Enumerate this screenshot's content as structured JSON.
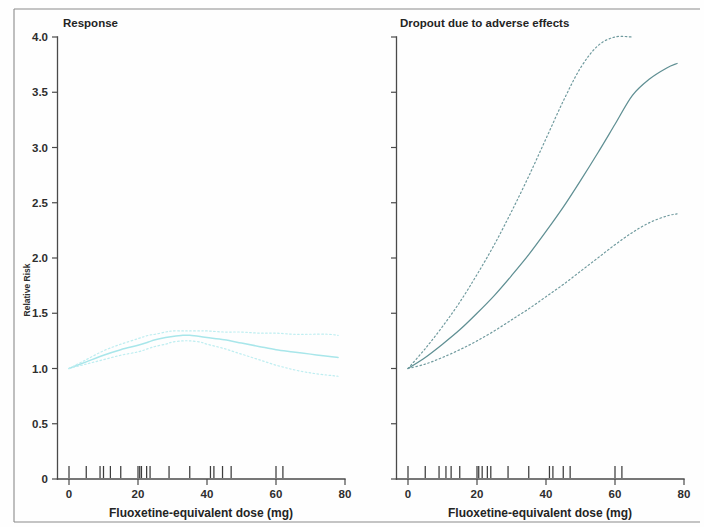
{
  "figure": {
    "kind": "two-panel-dose-response-figure",
    "x_axis_title": "Fluoxetine-equivalent dose (mg)",
    "y_axis_title": "Relative Risk"
  },
  "chart_data": [
    {
      "type": "line",
      "panel": "left",
      "title": "Response",
      "xlabel": "Fluoxetine-equivalent dose (mg)",
      "ylabel": "Relative Risk",
      "xlim": [
        0,
        80
      ],
      "ylim": [
        0,
        4.0
      ],
      "xticks": [
        0,
        20,
        40,
        60,
        80
      ],
      "xticklabels": [
        "0",
        "20",
        "40",
        "60",
        "80"
      ],
      "yticks": [
        0,
        0.5,
        1.0,
        1.5,
        2.0,
        2.5,
        3.0,
        3.5,
        4.0
      ],
      "yticklabels": [
        "0",
        "0.5",
        "1.0",
        "1.5",
        "2.0",
        "2.5",
        "3.0",
        "3.5",
        "4.0"
      ],
      "grid": false,
      "legend": "none",
      "line_color": "#a8e6ea",
      "ci_color": "#bfeef1",
      "x": [
        0,
        5,
        10,
        15,
        20,
        23,
        25,
        28,
        30,
        33,
        35,
        38,
        40,
        45,
        50,
        55,
        60,
        65,
        70,
        75,
        78
      ],
      "series": [
        {
          "name": "Relative risk (fitted)",
          "style": "solid",
          "values": [
            1.0,
            1.06,
            1.12,
            1.17,
            1.21,
            1.24,
            1.26,
            1.28,
            1.29,
            1.3,
            1.3,
            1.29,
            1.28,
            1.26,
            1.23,
            1.2,
            1.17,
            1.15,
            1.13,
            1.11,
            1.1
          ]
        },
        {
          "name": "Upper 95% confidence limit",
          "style": "dotted",
          "values": [
            1.0,
            1.08,
            1.16,
            1.22,
            1.27,
            1.3,
            1.31,
            1.33,
            1.34,
            1.34,
            1.34,
            1.34,
            1.34,
            1.33,
            1.33,
            1.32,
            1.32,
            1.31,
            1.31,
            1.31,
            1.3
          ]
        },
        {
          "name": "Lower 95% confidence limit",
          "style": "dotted",
          "values": [
            1.0,
            1.04,
            1.08,
            1.12,
            1.15,
            1.18,
            1.2,
            1.22,
            1.24,
            1.25,
            1.25,
            1.24,
            1.22,
            1.18,
            1.13,
            1.08,
            1.03,
            0.99,
            0.96,
            0.94,
            0.93
          ]
        }
      ],
      "rug_marks": [
        0,
        5,
        9,
        10,
        12,
        15,
        20,
        20.5,
        21,
        22.5,
        23.5,
        29,
        35,
        41,
        42,
        44.5,
        47,
        60,
        62
      ]
    },
    {
      "type": "line",
      "panel": "right",
      "title": "Dropout due to adverse effects",
      "xlabel": "Fluoxetine-equivalent dose (mg)",
      "ylabel": "Relative Risk",
      "xlim": [
        0,
        80
      ],
      "ylim": [
        0,
        4.0
      ],
      "xticks": [
        0,
        20,
        40,
        60,
        80
      ],
      "xticklabels": [
        "0",
        "20",
        "40",
        "60",
        "80"
      ],
      "yticks": [
        0,
        0.5,
        1.0,
        1.5,
        2.0,
        2.5,
        3.0,
        3.5,
        4.0
      ],
      "yticklabels": [],
      "grid": false,
      "legend": "none",
      "line_color": "#5f8f93",
      "ci_color": "#6f9a9e",
      "x": [
        0,
        5,
        10,
        15,
        20,
        25,
        30,
        35,
        40,
        45,
        50,
        55,
        60,
        65,
        70,
        75,
        78
      ],
      "series": [
        {
          "name": "Relative risk (fitted)",
          "style": "solid",
          "values": [
            1.0,
            1.1,
            1.22,
            1.35,
            1.5,
            1.66,
            1.84,
            2.03,
            2.24,
            2.46,
            2.7,
            2.95,
            3.21,
            3.47,
            3.62,
            3.72,
            3.76
          ]
        },
        {
          "name": "Upper 95% confidence limit",
          "style": "dotted",
          "values": [
            1.0,
            1.18,
            1.38,
            1.6,
            1.85,
            2.12,
            2.42,
            2.74,
            3.08,
            3.42,
            3.72,
            3.92,
            4.0,
            4.0,
            null,
            null,
            null
          ]
        },
        {
          "name": "Lower 95% confidence limit",
          "style": "dotted",
          "values": [
            1.0,
            1.04,
            1.1,
            1.17,
            1.25,
            1.34,
            1.44,
            1.54,
            1.65,
            1.76,
            1.88,
            2.0,
            2.12,
            2.23,
            2.32,
            2.38,
            2.4
          ]
        }
      ],
      "rug_marks": [
        0,
        5,
        9,
        11,
        12.5,
        15,
        20,
        20.5,
        21.5,
        23,
        24,
        29,
        35,
        41,
        42,
        45,
        47,
        60,
        62
      ]
    }
  ],
  "colors": {
    "left_curve": "#a8e6ea",
    "left_ci": "#bfeef1",
    "right_curve": "#5f8f93",
    "right_ci": "#6f9a9e",
    "axis": "#4a4a4a",
    "text": "#242424",
    "background": "#fefefe"
  }
}
